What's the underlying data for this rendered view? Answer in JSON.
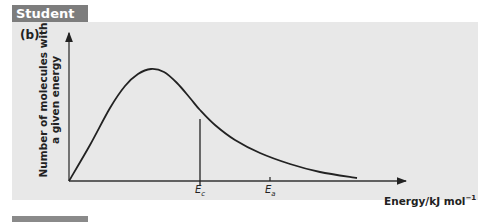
{
  "header": {
    "tab_label": "Student A",
    "part_label": "(b)"
  },
  "chart_data": {
    "type": "line",
    "title": "",
    "xlabel": "Energy/kJ mol⁻¹",
    "ylabel": "Number of molecules with a given energy",
    "ylabel_lines": [
      "Number of molecules with",
      "a given energy"
    ],
    "xlabel_main": "Energy/kJ mol",
    "xlabel_sup": "−1",
    "grid": false,
    "legend": null,
    "series": [
      {
        "name": "Maxwell–Boltzmann distribution",
        "points_px": [
          [
            69,
            181
          ],
          [
            90,
            145
          ],
          [
            110,
            108
          ],
          [
            125,
            86
          ],
          [
            138,
            74
          ],
          [
            151,
            69
          ],
          [
            164,
            72
          ],
          [
            177,
            83
          ],
          [
            190,
            98
          ],
          [
            200,
            110
          ],
          [
            215,
            125
          ],
          [
            235,
            140
          ],
          [
            260,
            153
          ],
          [
            290,
            164
          ],
          [
            320,
            172
          ],
          [
            357,
            178
          ]
        ]
      }
    ],
    "markers": [
      {
        "label_main": "E",
        "label_sub": "c",
        "x_px": 200,
        "line_from_y_px": 119,
        "type": "vertical-line"
      },
      {
        "label_main": "E",
        "label_sub": "a",
        "x_px": 270,
        "type": "tick"
      }
    ],
    "axes": {
      "origin_px": [
        69,
        181
      ],
      "x_end_px": 405,
      "y_end_px": 32,
      "arrows": true,
      "numeric_ticks": false
    }
  }
}
